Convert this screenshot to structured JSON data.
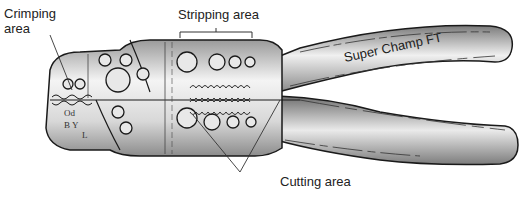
{
  "diagram": {
    "labels": {
      "crimping": [
        "Crimping",
        "area"
      ],
      "stripping": "Stripping area",
      "cutting": "Cutting area"
    },
    "handle_text": "Super Champ FT",
    "jaw_markings": [
      "Od",
      "B Y",
      "L"
    ],
    "colors": {
      "background": "#ffffff",
      "metal_light": "#f2f2f2",
      "metal_dark": "#8a8a8a",
      "handle_light": "#e6e6e6",
      "handle_dark": "#6e6e6e",
      "outline": "#1a1a1a",
      "leader_line": "#333333"
    }
  }
}
